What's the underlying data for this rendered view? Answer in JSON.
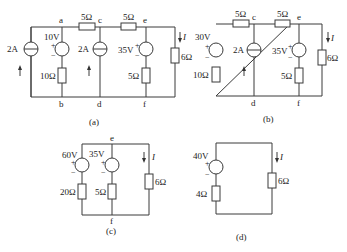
{
  "figure": {
    "panels": [
      {
        "caption": "(a)",
        "nodes": [
          "a",
          "b",
          "c",
          "d",
          "e",
          "f"
        ],
        "elements": {
          "current_source_left": "2A",
          "voltage_source_ab": "10V",
          "resistor_ab": "10Ω",
          "resistor_ac": "5Ω",
          "current_source_cd": "2A",
          "resistor_ce": "5Ω",
          "voltage_source_ef": "35V",
          "resistor_ef": "5Ω",
          "load_resistor": "6Ω",
          "load_current": "I"
        }
      },
      {
        "caption": "(b)",
        "nodes": [
          "c",
          "d",
          "e",
          "f"
        ],
        "elements": {
          "voltage_source_left": "30V",
          "resistor_left": "10Ω",
          "resistor_top_left": "5Ω",
          "current_source_cd": "2A",
          "resistor_ce": "5Ω",
          "voltage_source_ef": "35V",
          "resistor_ef": "5Ω",
          "load_resistor": "6Ω",
          "load_current": "I"
        }
      },
      {
        "caption": "(c)",
        "nodes": [
          "e",
          "f"
        ],
        "elements": {
          "voltage_source_left": "60V",
          "resistor_left": "20Ω",
          "voltage_source_ef": "35V",
          "resistor_ef": "5Ω",
          "load_resistor": "6Ω",
          "load_current": "I"
        }
      },
      {
        "caption": "(d)",
        "elements": {
          "voltage_source": "40V",
          "resistor_series": "4Ω",
          "load_resistor": "6Ω",
          "load_current": "I"
        }
      }
    ],
    "symbols": {
      "plus": "+",
      "minus": "−"
    }
  }
}
